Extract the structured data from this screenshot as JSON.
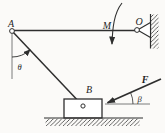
{
  "figure": {
    "type": "statics-mechanics-diagram",
    "labels": {
      "point_a": "A",
      "point_o": "O",
      "point_b": "B",
      "moment": "M",
      "force": "F",
      "angle_theta": "θ",
      "angle_beta": "β"
    },
    "colors": {
      "stroke": "#2e2e2e",
      "thin_line": "#5a5a5a",
      "label": "#1f1f1f",
      "background": "#fbfaf8"
    }
  }
}
